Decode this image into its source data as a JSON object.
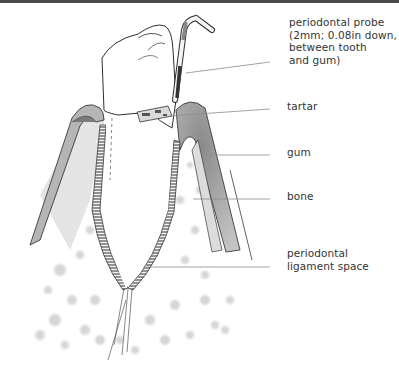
{
  "figure": {
    "colors": {
      "border": "#4a4a4a",
      "ink": "#3a3a3a",
      "gum_fill": "#9a9a9a",
      "bone_fill": "#d8d8d8",
      "label_text": "#333333",
      "leader_line": "#888888"
    }
  },
  "labels": [
    {
      "id": "probe",
      "lines": [
        "periodontal probe",
        "(2mm; 0.08in down,",
        "between tooth",
        "and gum)"
      ]
    },
    {
      "id": "tartar",
      "lines": [
        "tartar"
      ]
    },
    {
      "id": "gum",
      "lines": [
        "gum"
      ]
    },
    {
      "id": "bone",
      "lines": [
        "bone"
      ]
    },
    {
      "id": "ligament",
      "lines": [
        "periodontal",
        "ligament space"
      ]
    }
  ]
}
